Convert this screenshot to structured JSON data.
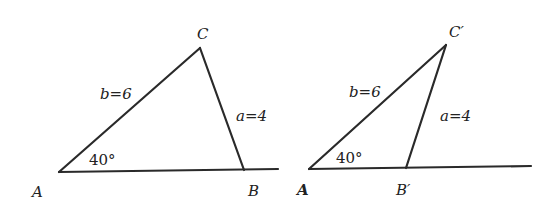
{
  "figures": [
    {
      "id": "triangle-1",
      "vertices": {
        "A": "A",
        "B": "B",
        "C": "C"
      },
      "side_b_label": "b=6",
      "side_a_label": "a=4",
      "angle_label": "40°"
    },
    {
      "id": "triangle-2",
      "vertices": {
        "A": "A",
        "B": "B′",
        "C": "C′"
      },
      "side_b_label": "b=6",
      "side_a_label": "a=4",
      "angle_label": "40°"
    }
  ],
  "colors": {
    "stroke": "#2a2a2a",
    "text": "#222222",
    "background": "#ffffff"
  }
}
